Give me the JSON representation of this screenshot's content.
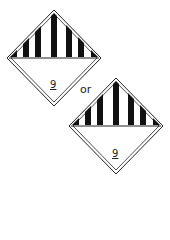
{
  "figure": {
    "caption": "Class 9 hazard label variants",
    "labels": [
      {
        "name": "class-9-label-variant-1",
        "class_number": "9",
        "stripes": 7,
        "center": [
          54,
          58
        ],
        "half_size": 47
      },
      {
        "name": "class-9-label-variant-2",
        "class_number": "9",
        "stripes": 7,
        "center": [
          116,
          126
        ],
        "half_size": 47
      }
    ],
    "separator_text": "or",
    "colors": {
      "stripe": "#111111",
      "background": "#ffffff",
      "outline": "#222222"
    }
  }
}
